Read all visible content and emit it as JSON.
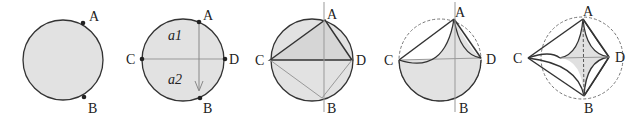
{
  "figure": {
    "colors": {
      "fill": "#e0e0e0",
      "stroke": "#333333",
      "thin": "#888888",
      "dashed": "#777777"
    },
    "panels": [
      {
        "id": 1,
        "labels": {
          "A": "A",
          "B": "B"
        }
      },
      {
        "id": 2,
        "labels": {
          "A": "A",
          "B": "B",
          "C": "C",
          "D": "D",
          "a1": "a1",
          "a2": "a2"
        }
      },
      {
        "id": 3,
        "labels": {
          "A": "A",
          "B": "B",
          "C": "C",
          "D": "D"
        }
      },
      {
        "id": 4,
        "labels": {
          "A": "A",
          "B": "B",
          "C": "C",
          "D": "D"
        }
      },
      {
        "id": 5,
        "labels": {
          "A": "A",
          "B": "B",
          "C": "C",
          "D": "D"
        }
      }
    ]
  }
}
